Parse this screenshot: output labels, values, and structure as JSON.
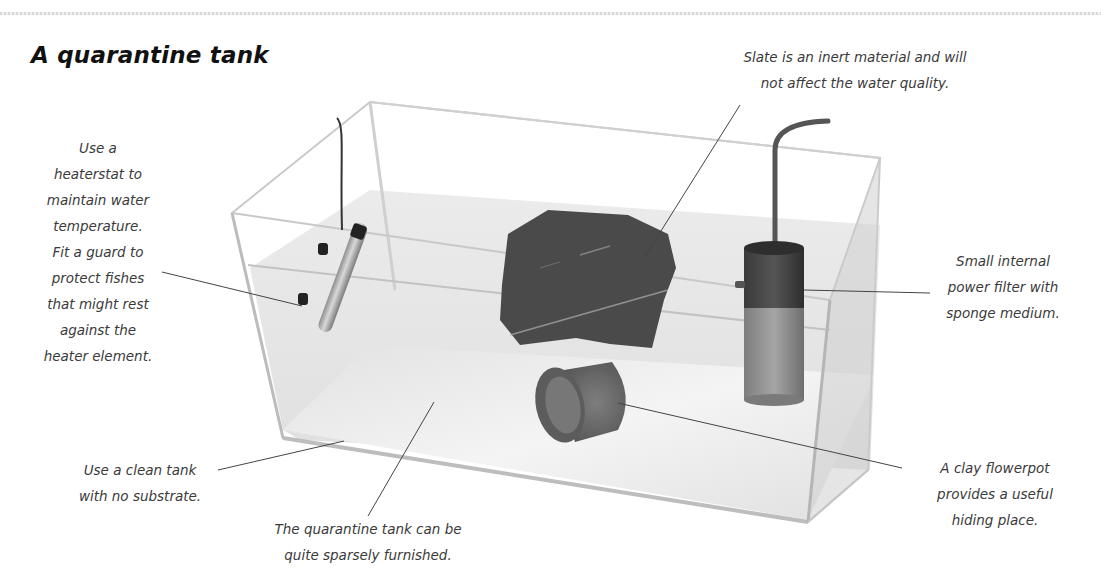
{
  "title": "A quarantine tank",
  "labels": {
    "heater": [
      "Use a",
      "heaterstat to",
      "maintain water",
      "temperature.",
      "Fit a guard to",
      "protect fishes",
      "that might rest",
      "against the",
      "heater element."
    ],
    "slate": [
      "Slate is an inert material and will",
      "not affect the water quality."
    ],
    "filter": [
      "Small internal",
      "power filter with",
      "sponge medium."
    ],
    "flowerpot": [
      "A clay flowerpot",
      "provides a useful",
      "hiding place."
    ],
    "clean_tank": [
      "Use a clean tank",
      "with no substrate."
    ],
    "sparse": [
      "The quarantine tank can be",
      "quite sparsely furnished."
    ]
  },
  "components": [
    {
      "name": "heaterstat",
      "icon": "heater-icon"
    },
    {
      "name": "slate rock",
      "icon": "rock-icon"
    },
    {
      "name": "internal power filter",
      "icon": "filter-icon"
    },
    {
      "name": "clay flowerpot",
      "icon": "flowerpot-icon"
    },
    {
      "name": "glass tank",
      "icon": "tank-icon"
    }
  ],
  "colors": {
    "text": "#3a3a3a",
    "title": "#111111",
    "rock": "#4a4a4a",
    "filter_dark": "#3c3c3c",
    "filter_light": "#8a8a8a",
    "pot": "#6a6a6a",
    "water": "#e6e6e6",
    "leader_line": "#444444"
  }
}
